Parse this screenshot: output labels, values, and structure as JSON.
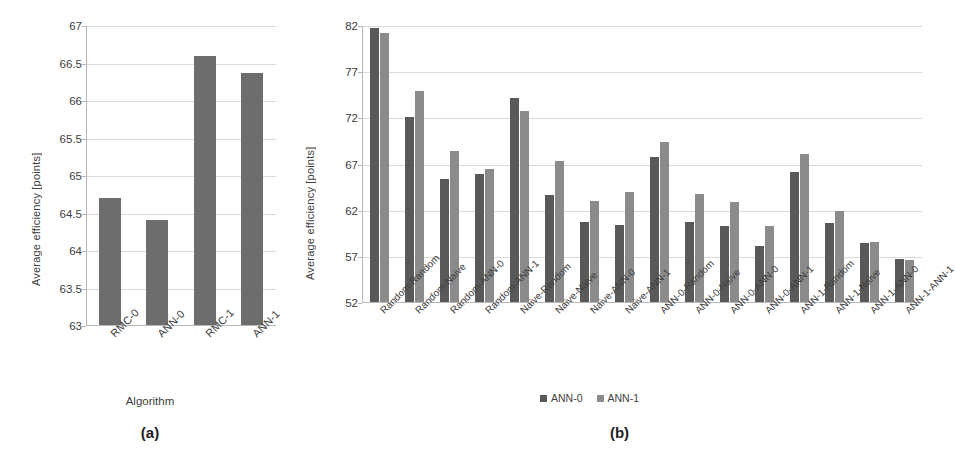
{
  "figure": {
    "background": "#ffffff",
    "series_colors": {
      "ann0": "#595959",
      "ann1": "#8b8b8b",
      "single": "#6d6d6d"
    }
  },
  "panel_a": {
    "caption": "(a)",
    "chart_data": {
      "type": "bar",
      "title": "",
      "xlabel": "Algorithm",
      "ylabel": "Average efficiency [points]",
      "categories": [
        "RMC-0",
        "ANN-0",
        "RMC-1",
        "ANN-1"
      ],
      "values": [
        64.71,
        64.42,
        66.6,
        66.37
      ],
      "ylim": [
        63,
        67
      ],
      "yticks": [
        63,
        63.5,
        64,
        64.5,
        65,
        65.5,
        66,
        66.5,
        67
      ],
      "ytick_labels": [
        "63",
        "63.5",
        "64",
        "64.5",
        "65",
        "65.5",
        "66",
        "66.5",
        "67"
      ],
      "grid": true,
      "legend": null
    }
  },
  "panel_b": {
    "caption": "(b)",
    "chart_data": {
      "type": "bar",
      "title": "",
      "xlabel": "",
      "ylabel": "Average efficiency [points]",
      "categories": [
        "Random-Random",
        "Random-Naive",
        "Random-ANN-0",
        "Random-ANN-1",
        "Naive-Random",
        "Naive-Naive",
        "Naive-ANN-0",
        "Naive-ANN-1",
        "ANN-0-Random",
        "ANN-0-Naive",
        "ANN-0-ANN-0",
        "ANN-0-ANN-1",
        "ANN-1-Random",
        "ANN-1-Naive",
        "ANN-1-ANN-0",
        "ANN-1-ANN-1"
      ],
      "series": [
        {
          "name": "ANN-0",
          "color": "#595959",
          "values": [
            81.8,
            72.1,
            65.4,
            66.0,
            74.2,
            63.7,
            60.8,
            60.5,
            67.8,
            60.8,
            60.3,
            58.2,
            66.2,
            60.7,
            58.5,
            56.8
          ]
        },
        {
          "name": "ANN-1",
          "color": "#8b8b8b",
          "values": [
            81.2,
            75.0,
            68.5,
            66.5,
            72.8,
            67.4,
            63.1,
            64.0,
            69.4,
            63.8,
            62.9,
            60.3,
            68.1,
            62.0,
            58.6,
            56.7
          ]
        }
      ],
      "ylim": [
        52,
        82
      ],
      "yticks": [
        52,
        57,
        62,
        67,
        72,
        77,
        82
      ],
      "ytick_labels": [
        "52",
        "57",
        "62",
        "67",
        "72",
        "77",
        "82"
      ],
      "grid": true,
      "legend": {
        "position": "bottom",
        "entries": [
          "ANN-0",
          "ANN-1"
        ]
      }
    }
  }
}
